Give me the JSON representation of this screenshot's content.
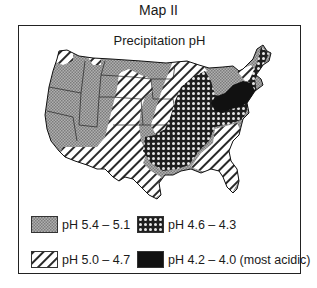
{
  "title": "Map II",
  "map": {
    "title": "Precipitation pH",
    "region": "Contiguous United States"
  },
  "legend": {
    "items": [
      {
        "label": "pH 5.4 – 5.1",
        "pattern": "fine-gray-dots",
        "color": "#9a9a9a"
      },
      {
        "label": "pH 4.6 – 4.3",
        "pattern": "dark-with-white-circles",
        "color": "#2b2b2b"
      },
      {
        "label": "pH 5.0 – 4.7",
        "pattern": "diagonal-hatch",
        "color": "#ffffff"
      },
      {
        "label": "pH 4.2 – 4.0 (most acidic)",
        "pattern": "solid-black",
        "color": "#111111"
      }
    ]
  }
}
